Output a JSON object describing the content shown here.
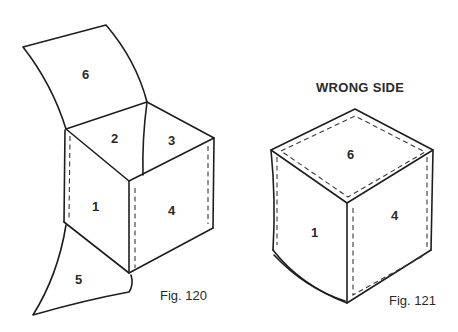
{
  "figures": [
    {
      "id": "fig-120",
      "caption": "Fig. 120",
      "faces": {
        "1": "1",
        "2": "2",
        "3": "3",
        "4": "4",
        "5": "5",
        "6": "6"
      }
    },
    {
      "id": "fig-121",
      "heading": "WRONG SIDE",
      "caption": "Fig. 121",
      "faces": {
        "1": "1",
        "4": "4",
        "6": "6"
      }
    }
  ],
  "colors": {
    "ink": "#1e1e1e",
    "background": "#ffffff"
  }
}
